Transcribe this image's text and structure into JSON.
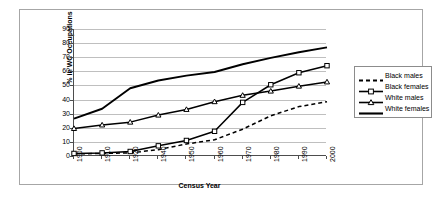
{
  "chart_data": {
    "type": "line",
    "title": "",
    "xlabel": "Census Year",
    "ylabel": "% in WC Occupations",
    "categories": [
      "1900",
      "1910",
      "1920",
      "1940",
      "1950",
      "1960",
      "1970",
      "1980",
      "1990",
      "2000"
    ],
    "xlim": [
      0,
      9
    ],
    "ylim": [
      0,
      90
    ],
    "yticks": [
      0,
      10,
      20,
      30,
      40,
      50,
      60,
      70,
      80,
      90
    ],
    "grid": "horizontal",
    "legend_position": "right",
    "series": [
      {
        "name": "Black males",
        "style": "dashed",
        "marker": "none",
        "color": "#000000",
        "values": [
          1.5,
          1.8,
          2.2,
          4.5,
          8.5,
          11.5,
          19.0,
          28.5,
          35.0,
          38.5
        ]
      },
      {
        "name": "Black females",
        "style": "solid",
        "marker": "square",
        "color": "#000000",
        "values": [
          1.8,
          2.2,
          3.2,
          7.2,
          11.0,
          17.5,
          38.0,
          50.5,
          59.0,
          64.0
        ]
      },
      {
        "name": "White males",
        "style": "solid",
        "marker": "triangle",
        "color": "#000000",
        "values": [
          19.5,
          22.0,
          24.0,
          29.0,
          33.0,
          38.5,
          43.0,
          46.0,
          49.5,
          52.5
        ]
      },
      {
        "name": "White females",
        "style": "solid-thick",
        "marker": "none",
        "color": "#000000",
        "values": [
          26.5,
          33.5,
          48.0,
          53.5,
          57.0,
          59.5,
          65.0,
          69.5,
          73.5,
          77.0
        ]
      }
    ]
  },
  "legend": {
    "items": [
      {
        "label": "Black males"
      },
      {
        "label": "Black females"
      },
      {
        "label": "White males"
      },
      {
        "label": "White females"
      }
    ]
  },
  "axes": {
    "x_title": "Census Year",
    "y_title": "% in WC Occupations"
  }
}
